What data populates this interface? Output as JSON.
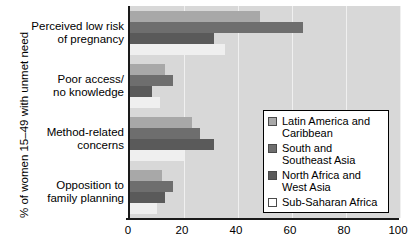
{
  "chart_data": {
    "type": "bar",
    "orientation": "horizontal",
    "title": "",
    "xlabel": "",
    "ylabel": "% of women 15–49 with unmet need",
    "xlim": [
      0,
      100
    ],
    "xticks": [
      0,
      20,
      40,
      60,
      80,
      100
    ],
    "xtick_labels": [
      "0",
      "20",
      "40",
      "60",
      "80",
      "100"
    ],
    "grid": true,
    "legend_position": "bottom-right",
    "categories": [
      "Perceived low risk of pregnancy",
      "Poor access/ no knowledge",
      "Method-related concerns",
      "Opposition to family planning"
    ],
    "category_lines": [
      [
        "Perceived low risk",
        "of pregnancy"
      ],
      [
        "Poor access/",
        "no knowledge"
      ],
      [
        "Method-related",
        "concerns"
      ],
      [
        "Opposition to",
        "family planning"
      ]
    ],
    "series": [
      {
        "name": "Latin America and Caribbean",
        "name_lines": [
          "Latin America and",
          "Caribbean"
        ],
        "color": "#a8a8a8",
        "values": [
          48,
          13,
          23,
          12
        ]
      },
      {
        "name": "South and Southeast Asia",
        "name_lines": [
          "South and",
          "Southeast Asia"
        ],
        "color": "#6e6e6e",
        "values": [
          64,
          16,
          26,
          16
        ]
      },
      {
        "name": "North Africa and West Asia",
        "name_lines": [
          "North Africa and",
          "West Asia"
        ],
        "color": "#5a5a5a",
        "values": [
          31,
          8,
          31,
          13
        ]
      },
      {
        "name": "Sub-Saharan Africa",
        "name_lines": [
          "Sub-Saharan Africa"
        ],
        "color": "#ffffff",
        "values": [
          35,
          11,
          20,
          10
        ]
      }
    ]
  },
  "axis": {
    "ylabel": "% of women 15–49 with unmet need"
  },
  "legend": {
    "items": [
      {
        "label_line1": "Latin America and",
        "label_line2": "Caribbean",
        "swatch": "legend-swatch-latin-america"
      },
      {
        "label_line1": "South and",
        "label_line2": "Southeast Asia",
        "swatch": "legend-swatch-south-asia"
      },
      {
        "label_line1": "North Africa and",
        "label_line2": "West Asia",
        "swatch": "legend-swatch-north-africa"
      },
      {
        "label_line1": "Sub-Saharan Africa",
        "label_line2": "",
        "swatch": "legend-swatch-sub-saharan"
      }
    ]
  }
}
